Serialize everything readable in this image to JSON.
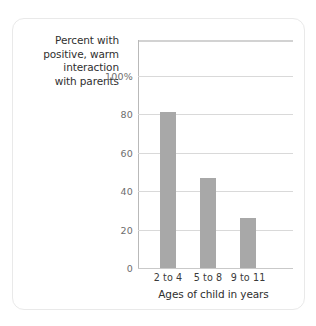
{
  "chart_data": {
    "type": "bar",
    "title": "",
    "subtitle": "",
    "xlabel": "Ages of child in years",
    "ylabel": "Percent with positive, warm interaction with parents",
    "ylabel_lines": [
      "Percent with",
      "positive, warm",
      "interaction",
      "with parents"
    ],
    "categories": [
      "2 to 4",
      "5 to 8",
      "9 to 11"
    ],
    "values": [
      81,
      47,
      26
    ],
    "ylim": [
      0,
      108
    ],
    "yticks": [
      0,
      20,
      40,
      60,
      80,
      100
    ],
    "ytick_labels": [
      "0",
      "20",
      "40",
      "60",
      "80",
      "100%"
    ],
    "grid": true,
    "legend": false,
    "bar_color": "#a8a8a8",
    "gridline_color": "#d9d9d9",
    "axis_color": "#b9b9b9",
    "background": "#ffffff",
    "card_border_color": "#e9e9e9"
  }
}
